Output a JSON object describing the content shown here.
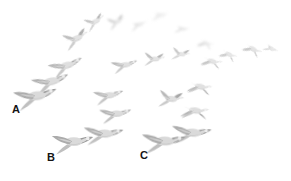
{
  "figure": {
    "background_color": "#ffffff",
    "width": 291,
    "height": 181
  },
  "labels": [
    {
      "id": "label-a",
      "text": "A",
      "x": 12,
      "y": 104,
      "color": "#141414"
    },
    {
      "id": "label-b",
      "text": "B",
      "x": 47,
      "y": 152,
      "color": "#141414"
    },
    {
      "id": "label-c",
      "text": "C",
      "x": 140,
      "y": 150,
      "color": "#141414"
    }
  ],
  "palette": {
    "bird_body_light": "#d8d8d8",
    "bird_body_mid": "#bcbcbc",
    "bird_wing_dark": "#a8a8a8",
    "bird_wing_darker": "#949494",
    "bird_highlight": "#ececec",
    "label_color": "#141414"
  },
  "birds": [
    {
      "name": "bird-a-foreground",
      "x": 12,
      "y": 80,
      "w": 46,
      "h": 34,
      "rot": -6,
      "tone": 0.95,
      "blur": 0.25,
      "pose": "wings-spread"
    },
    {
      "name": "bird-arc-1",
      "x": 30,
      "y": 68,
      "w": 40,
      "h": 29,
      "rot": -10,
      "tone": 0.88,
      "blur": 0.3,
      "pose": "wings-spread"
    },
    {
      "name": "bird-arc-2",
      "x": 47,
      "y": 53,
      "w": 37,
      "h": 27,
      "rot": -14,
      "tone": 0.82,
      "blur": 0.4,
      "pose": "wings-spread"
    },
    {
      "name": "bird-arc-3",
      "x": 60,
      "y": 28,
      "w": 31,
      "h": 23,
      "rot": -20,
      "tone": 0.74,
      "blur": 0.5,
      "pose": "wings-up"
    },
    {
      "name": "bird-arc-4",
      "x": 82,
      "y": 13,
      "w": 25,
      "h": 19,
      "rot": -24,
      "tone": 0.66,
      "blur": 0.7,
      "pose": "wings-up"
    },
    {
      "name": "bird-arc-5",
      "x": 105,
      "y": 14,
      "w": 22,
      "h": 17,
      "rot": -18,
      "tone": 0.58,
      "blur": 0.9,
      "pose": "wings-up"
    },
    {
      "name": "bird-arc-6",
      "x": 128,
      "y": 17,
      "w": 20,
      "h": 16,
      "rot": -8,
      "tone": 0.5,
      "blur": 1.1,
      "pose": "wings-folded"
    },
    {
      "name": "bird-arc-7",
      "x": 150,
      "y": 8,
      "w": 19,
      "h": 15,
      "rot": 4,
      "tone": 0.44,
      "blur": 1.4,
      "pose": "wings-folded"
    },
    {
      "name": "bird-arc-8",
      "x": 173,
      "y": 22,
      "w": 17,
      "h": 14,
      "rot": 12,
      "tone": 0.48,
      "blur": 1.0,
      "pose": "wings-folded"
    },
    {
      "name": "bird-arc-9",
      "x": 196,
      "y": 36,
      "w": 18,
      "h": 15,
      "rot": 20,
      "tone": 0.56,
      "blur": 0.8,
      "pose": "wings-down"
    },
    {
      "name": "bird-arc-10",
      "x": 218,
      "y": 46,
      "w": 20,
      "h": 17,
      "rot": 26,
      "tone": 0.64,
      "blur": 0.6,
      "pose": "wings-down"
    },
    {
      "name": "bird-arc-11",
      "x": 241,
      "y": 40,
      "w": 22,
      "h": 18,
      "rot": 30,
      "tone": 0.68,
      "blur": 0.5,
      "pose": "wings-down"
    },
    {
      "name": "bird-arc-12",
      "x": 262,
      "y": 41,
      "w": 17,
      "h": 15,
      "rot": 34,
      "tone": 0.6,
      "blur": 0.7,
      "pose": "wings-folded"
    },
    {
      "name": "bird-mid-1",
      "x": 110,
      "y": 55,
      "w": 28,
      "h": 21,
      "rot": -6,
      "tone": 0.8,
      "blur": 0.4,
      "pose": "wings-spread"
    },
    {
      "name": "bird-mid-2",
      "x": 141,
      "y": 50,
      "w": 25,
      "h": 19,
      "rot": 2,
      "tone": 0.72,
      "blur": 0.5,
      "pose": "wings-up"
    },
    {
      "name": "bird-mid-3",
      "x": 169,
      "y": 46,
      "w": 22,
      "h": 17,
      "rot": 8,
      "tone": 0.66,
      "blur": 0.6,
      "pose": "wings-up"
    },
    {
      "name": "bird-mid-4",
      "x": 199,
      "y": 52,
      "w": 24,
      "h": 19,
      "rot": 16,
      "tone": 0.7,
      "blur": 0.5,
      "pose": "wings-down"
    },
    {
      "name": "bird-mid-5",
      "x": 92,
      "y": 84,
      "w": 32,
      "h": 24,
      "rot": -4,
      "tone": 0.86,
      "blur": 0.3,
      "pose": "wings-spread"
    },
    {
      "name": "bird-mid-6",
      "x": 185,
      "y": 76,
      "w": 28,
      "h": 22,
      "rot": 12,
      "tone": 0.78,
      "blur": 0.4,
      "pose": "wings-down"
    },
    {
      "name": "bird-low-1",
      "x": 98,
      "y": 102,
      "w": 34,
      "h": 25,
      "rot": -2,
      "tone": 0.9,
      "blur": 0.25,
      "pose": "wings-spread"
    },
    {
      "name": "bird-low-2",
      "x": 178,
      "y": 99,
      "w": 32,
      "h": 24,
      "rot": 8,
      "tone": 0.85,
      "blur": 0.3,
      "pose": "wings-down"
    },
    {
      "name": "bird-b-foreground",
      "x": 50,
      "y": 126,
      "w": 44,
      "h": 33,
      "rot": 0,
      "tone": 0.96,
      "blur": 0.2,
      "pose": "wings-spread"
    },
    {
      "name": "bird-b-second",
      "x": 82,
      "y": 119,
      "w": 42,
      "h": 31,
      "rot": 2,
      "tone": 0.93,
      "blur": 0.22,
      "pose": "wings-spread"
    },
    {
      "name": "bird-c-foreground",
      "x": 140,
      "y": 125,
      "w": 46,
      "h": 34,
      "rot": 2,
      "tone": 0.97,
      "blur": 0.2,
      "pose": "wings-spread"
    },
    {
      "name": "bird-c-second",
      "x": 170,
      "y": 118,
      "w": 42,
      "h": 31,
      "rot": 4,
      "tone": 0.94,
      "blur": 0.22,
      "pose": "wings-spread"
    },
    {
      "name": "bird-c-third",
      "x": 155,
      "y": 88,
      "w": 30,
      "h": 23,
      "rot": 6,
      "tone": 0.82,
      "blur": 0.35,
      "pose": "wings-up"
    }
  ]
}
